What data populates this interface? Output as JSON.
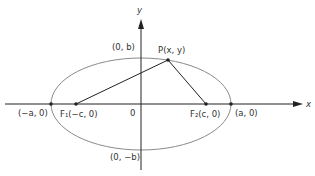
{
  "diagram": {
    "type": "ellipse-foci",
    "colors": {
      "axis": "#222222",
      "ellipse": "#888888",
      "segment": "#222222",
      "point": "#222222",
      "text": "#333333"
    },
    "axes": {
      "x_label": "x",
      "y_label": "y",
      "origin_label": "0"
    },
    "points": {
      "P": {
        "label": "P(x, y)"
      },
      "F1": {
        "label": "F₁(−c, 0)"
      },
      "F2": {
        "label": "F₂(c, 0)"
      },
      "left_vertex": {
        "label": "(−a, 0)"
      },
      "right_vertex": {
        "label": "(a, 0)"
      },
      "top_vertex": {
        "label": "(0, b)"
      },
      "bottom_vertex": {
        "label": "(0, −b)"
      }
    }
  }
}
